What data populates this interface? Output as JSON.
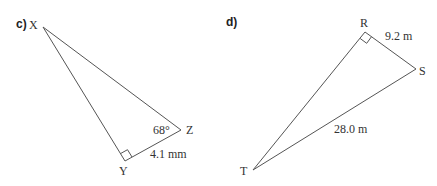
{
  "diagrams": [
    {
      "part_label": "c)",
      "vertices": {
        "X": "X",
        "Y": "Y",
        "Z": "Z"
      },
      "angle_label": "68°",
      "side_label": "4.1 mm",
      "right_angle_at": "Y"
    },
    {
      "part_label": "d)",
      "vertices": {
        "R": "R",
        "S": "S",
        "T": "T"
      },
      "side_rs_label": "9.2 m",
      "side_st_label": "28.0 m",
      "right_angle_at": "R"
    }
  ],
  "colors": {
    "line": "#555555",
    "text": "#333333"
  }
}
